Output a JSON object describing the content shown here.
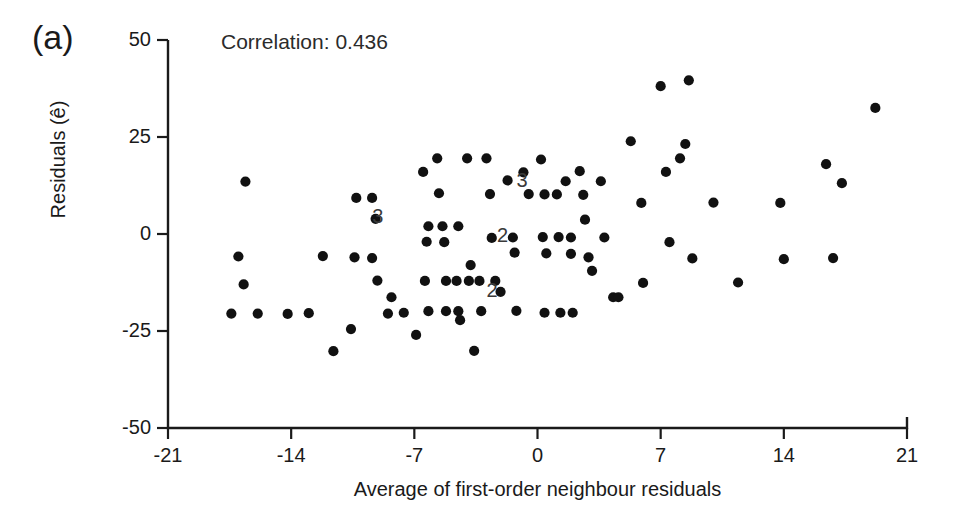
{
  "figure": {
    "panel_label": "(a)",
    "annotation": "Correlation: 0.436",
    "background_color": "#ffffff",
    "marker_color": "#111111",
    "axis_color": "#1a1a1a"
  },
  "chart_data": {
    "type": "scatter",
    "title": "",
    "subtitle": "",
    "xlabel": "Average of first-order neighbour residuals",
    "ylabel": "Residuals (ê)",
    "xlim": [
      -21,
      21
    ],
    "ylim": [
      -50,
      50
    ],
    "xticks": [
      -21,
      -14,
      -7,
      0,
      7,
      14,
      21
    ],
    "xtick_labels": [
      "-21",
      "-14",
      "-7",
      "0",
      "7",
      "14",
      "21"
    ],
    "yticks": [
      -50,
      -25,
      0,
      25,
      50
    ],
    "ytick_labels": [
      "-50",
      "-25",
      "0",
      "25",
      "50"
    ],
    "grid": false,
    "legend": null,
    "annotations": [
      {
        "text": "Correlation: 0.436",
        "x": -17.0,
        "y": 46.0
      },
      {
        "text": "(a)",
        "x": -24.5,
        "y": 47.0
      },
      {
        "text": "3",
        "x": -9.0,
        "y": 4.0,
        "note": "3 coincident points"
      },
      {
        "text": "3",
        "x": -0.8,
        "y": 13.5,
        "note": "3 coincident points"
      },
      {
        "text": "2",
        "x": -1.9,
        "y": -0.8,
        "note": "2 coincident points"
      },
      {
        "text": "2",
        "x": -2.5,
        "y": -14.9,
        "note": "2 coincident points"
      }
    ],
    "overlap_labels": [
      "3",
      "3",
      "2",
      "2"
    ],
    "n_points_plotted": 100,
    "points": [
      [
        -16.6,
        13.5
      ],
      [
        -17.0,
        -5.8
      ],
      [
        -16.7,
        -13.0
      ],
      [
        -17.4,
        -20.5
      ],
      [
        -15.9,
        -20.5
      ],
      [
        -14.2,
        -20.6
      ],
      [
        -13.0,
        -20.4
      ],
      [
        -12.2,
        -5.7
      ],
      [
        -11.6,
        -30.2
      ],
      [
        -10.6,
        -24.5
      ],
      [
        -10.3,
        9.3
      ],
      [
        -9.4,
        9.3
      ],
      [
        -10.4,
        -6.0
      ],
      [
        -9.4,
        -6.2
      ],
      [
        -9.2,
        3.9
      ],
      [
        -9.1,
        -12.0
      ],
      [
        -8.3,
        -16.3
      ],
      [
        -8.5,
        -20.5
      ],
      [
        -7.6,
        -20.3
      ],
      [
        -6.9,
        -26.0
      ],
      [
        -6.5,
        16.0
      ],
      [
        -6.2,
        2.0
      ],
      [
        -6.3,
        -2.0
      ],
      [
        -6.4,
        -12.1
      ],
      [
        -6.2,
        -19.9
      ],
      [
        -5.7,
        19.5
      ],
      [
        -5.6,
        10.5
      ],
      [
        -5.4,
        2.0
      ],
      [
        -5.3,
        -2.1
      ],
      [
        -5.2,
        -12.1
      ],
      [
        -5.2,
        -19.9
      ],
      [
        -4.5,
        2.0
      ],
      [
        -4.6,
        -12.1
      ],
      [
        -4.5,
        -19.9
      ],
      [
        -4.4,
        -22.2
      ],
      [
        -4.0,
        19.5
      ],
      [
        -3.8,
        -8.0
      ],
      [
        -3.9,
        -12.1
      ],
      [
        -3.6,
        -30.1
      ],
      [
        -3.3,
        -12.1
      ],
      [
        -3.2,
        -19.9
      ],
      [
        -2.9,
        19.5
      ],
      [
        -2.7,
        10.3
      ],
      [
        -2.6,
        -1.0
      ],
      [
        -2.4,
        -12.1
      ],
      [
        -2.1,
        -14.9
      ],
      [
        -1.7,
        13.8
      ],
      [
        -1.4,
        -0.9
      ],
      [
        -1.3,
        -4.8
      ],
      [
        -1.2,
        -19.8
      ],
      [
        -0.8,
        15.9
      ],
      [
        -0.5,
        10.3
      ],
      [
        0.2,
        19.2
      ],
      [
        0.4,
        10.2
      ],
      [
        0.3,
        -0.8
      ],
      [
        0.5,
        -5.0
      ],
      [
        0.4,
        -20.3
      ],
      [
        1.1,
        10.2
      ],
      [
        1.2,
        -0.8
      ],
      [
        1.3,
        -20.3
      ],
      [
        1.6,
        13.6
      ],
      [
        1.9,
        -0.9
      ],
      [
        1.9,
        -5.1
      ],
      [
        2.0,
        -20.3
      ],
      [
        2.4,
        16.2
      ],
      [
        2.6,
        10.1
      ],
      [
        2.7,
        3.7
      ],
      [
        2.9,
        -6.0
      ],
      [
        3.1,
        -9.5
      ],
      [
        3.6,
        13.6
      ],
      [
        3.8,
        -0.9
      ],
      [
        4.3,
        -16.3
      ],
      [
        4.6,
        -16.3
      ],
      [
        5.3,
        23.9
      ],
      [
        5.9,
        8.0
      ],
      [
        6.0,
        -12.6
      ],
      [
        7.0,
        38.1
      ],
      [
        7.3,
        16.0
      ],
      [
        7.5,
        -2.1
      ],
      [
        8.1,
        19.5
      ],
      [
        8.4,
        23.2
      ],
      [
        8.6,
        39.6
      ],
      [
        8.8,
        -6.3
      ],
      [
        10.0,
        8.1
      ],
      [
        11.4,
        -12.5
      ],
      [
        13.8,
        8.0
      ],
      [
        14.0,
        -6.5
      ],
      [
        16.4,
        18.0
      ],
      [
        16.8,
        -6.2
      ],
      [
        17.3,
        13.1
      ],
      [
        19.2,
        32.5
      ]
    ]
  }
}
